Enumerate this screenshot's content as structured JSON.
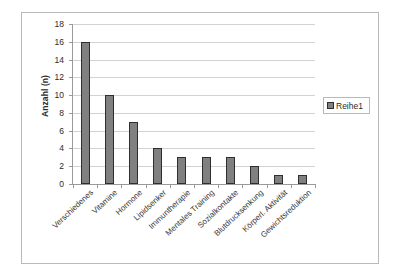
{
  "chart_data": {
    "type": "bar",
    "title": "",
    "subtitle": "",
    "xlabel": "",
    "ylabel": "Anzahl (n)",
    "ylim": [
      0,
      18
    ],
    "ytick_step": 2,
    "yticks": [
      0,
      2,
      4,
      6,
      8,
      10,
      12,
      14,
      16,
      18
    ],
    "grid": true,
    "legend_position": "right",
    "categories": [
      "Verschiedenes",
      "Vitamine",
      "Hormone",
      "Lipidsenker",
      "Immuntherapie",
      "Mentales Training",
      "Sozialkontakte",
      "Blutdrucksenkung",
      "Körperl. Aktivität",
      "Gewichtsreduktion"
    ],
    "series": [
      {
        "name": "Reihe1",
        "values": [
          16,
          10,
          7,
          4,
          3,
          3,
          3,
          2,
          1,
          1
        ]
      }
    ]
  },
  "legend": {
    "entries": [
      {
        "label": "Reihe1",
        "color": "#808080"
      }
    ]
  },
  "colors": {
    "bar_fill": "#808080",
    "bar_stroke": "#2e2e2e",
    "gridline": "#d2d2d2",
    "axis": "#9a9a9a",
    "frame": "#b9b9b9",
    "text": "#2b2b2b",
    "background": "#ffffff"
  }
}
